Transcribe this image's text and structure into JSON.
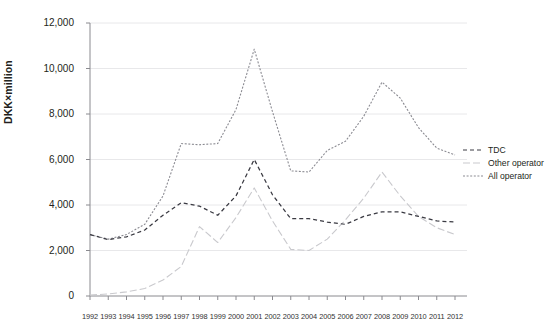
{
  "chart_data": {
    "type": "line",
    "title": "",
    "xlabel": "",
    "ylabel": "DKK×million",
    "xlim": [
      1992,
      2012
    ],
    "ylim": [
      0,
      12000
    ],
    "ytick_step": 2000,
    "grid": true,
    "legend_position": "right",
    "categories": [
      "1992",
      "1993",
      "1994",
      "1995",
      "1996",
      "1997",
      "1998",
      "1999",
      "2000",
      "2001",
      "2002",
      "2003",
      "2004",
      "2005",
      "2006",
      "2007",
      "2008",
      "2009",
      "2010",
      "2011",
      "2012"
    ],
    "ytick_labels": [
      "0",
      "2,000",
      "4,000",
      "6,000",
      "8,000",
      "10,000",
      "12,000"
    ],
    "ytick_values": [
      0,
      2000,
      4000,
      6000,
      8000,
      10000,
      12000
    ],
    "series": [
      {
        "name": "TDC",
        "style": "dashed",
        "color": "#3a3a42",
        "values": [
          2700,
          2480,
          2600,
          2900,
          3550,
          4100,
          3950,
          3550,
          4400,
          6000,
          4450,
          3400,
          3400,
          3250,
          3150,
          3500,
          3700,
          3700,
          3500,
          3300,
          3250
        ]
      },
      {
        "name": "Other operator",
        "style": "dashdot",
        "color": "#c9c9cd",
        "values": [
          40,
          90,
          180,
          330,
          700,
          1300,
          3050,
          2350,
          3450,
          4750,
          3300,
          2050,
          2000,
          2500,
          3350,
          4300,
          5450,
          4400,
          3500,
          3000,
          2700
        ]
      },
      {
        "name": "All operator",
        "style": "dotted",
        "color": "#8b8b92",
        "values": [
          2700,
          2500,
          2700,
          3150,
          4400,
          6700,
          6650,
          6700,
          8200,
          10850,
          8100,
          5500,
          5450,
          6400,
          6800,
          7900,
          9400,
          8700,
          7400,
          6500,
          6200
        ]
      }
    ]
  },
  "legend": {
    "items": [
      {
        "label": "TDC"
      },
      {
        "label": "Other operator"
      },
      {
        "label": "All operator"
      }
    ]
  },
  "axes": {
    "y_axis_title": "DKK×million"
  },
  "colors": {
    "grid": "#e8e8ea",
    "axis": "#8a8a8f",
    "text": "#231f20"
  }
}
